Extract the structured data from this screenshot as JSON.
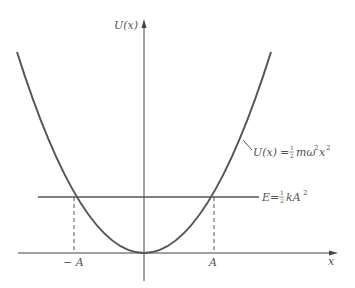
{
  "diagram": {
    "y_axis_label": "U(x)",
    "x_axis_label": "x",
    "curve_label": "U(x) = ½mω²x²",
    "curve_label_parts": {
      "lhs": "U(x)",
      "eq": "=",
      "frac_num": "1",
      "frac_den": "2",
      "rest": "mω",
      "sup1": "2",
      "var": "x",
      "sup2": "2"
    },
    "energy_label_parts": {
      "lhs": "E",
      "eq": "=",
      "frac_num": "1",
      "frac_den": "2",
      "rest": "kA",
      "sup": "2"
    },
    "energy_label": "E = ½kA²",
    "tick_labels": {
      "neg_amplitude": "− A",
      "pos_amplitude": "A"
    },
    "colors": {
      "curve": "#555555",
      "axes": "#444444",
      "text": "#555555"
    }
  }
}
